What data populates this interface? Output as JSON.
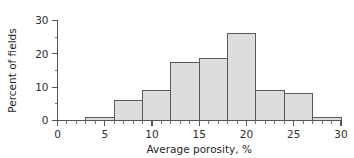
{
  "chart_data": {
    "type": "bar",
    "title": "",
    "subtitle": "",
    "xlabel": "Average porosity, %",
    "ylabel": "Percent of fields",
    "xlim": [
      0,
      30
    ],
    "ylim": [
      0,
      30
    ],
    "grid": false,
    "legend": null,
    "bin_width": 3,
    "bin_edges": [
      3,
      6,
      9,
      12,
      15,
      18,
      21,
      24,
      27,
      30
    ],
    "categories": [
      "3-6",
      "6-9",
      "9-12",
      "12-15",
      "15-18",
      "18-21",
      "21-24",
      "24-27",
      "27-30"
    ],
    "values": [
      1,
      6,
      9,
      17.5,
      18.5,
      26,
      9,
      8,
      1
    ],
    "x_ticks_major": [
      0,
      5,
      10,
      15,
      20,
      25,
      30
    ],
    "x_tick_labels": [
      "0",
      "5",
      "10",
      "15",
      "20",
      "25",
      "30"
    ],
    "x_minor_step": 1,
    "y_ticks_major": [
      0,
      10,
      20,
      30
    ],
    "y_tick_labels": [
      "0",
      "10",
      "20",
      "30"
    ],
    "y_ticks_minor": [
      5,
      15,
      25
    ],
    "bar_fill_color": "#dcdedc",
    "bar_edge_color": "#5a5a5a",
    "axis_color": "#555555",
    "text_color": "#2e2e2e",
    "background_color": "#ffffff"
  }
}
